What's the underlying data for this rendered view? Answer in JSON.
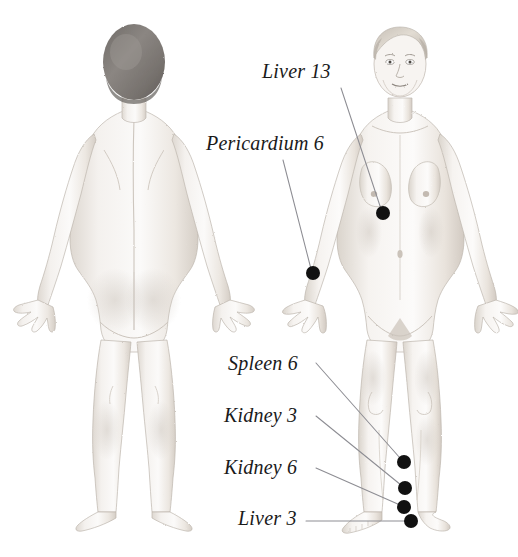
{
  "image": {
    "title": "Acupressure Points on Female Figure",
    "background_color": "#ffffff",
    "width": 518,
    "height": 557,
    "medium": "pencil-sketch illustration"
  },
  "figures": [
    {
      "id": "posterior-figure",
      "view": "back",
      "description": "Nude female figure viewed from behind, arms relaxed at sides, short dark hair",
      "bounds": {
        "x": 10,
        "y": 26,
        "width": 245,
        "height": 500
      }
    },
    {
      "id": "anterior-figure",
      "view": "front",
      "description": "Nude female figure viewed from the front, arms relaxed at sides, short light hair",
      "bounds": {
        "x": 285,
        "y": 26,
        "width": 225,
        "height": 505
      }
    }
  ],
  "labels": [
    {
      "id": "liver-13",
      "text": "Liver 13",
      "text_x": 262,
      "text_y": 61,
      "leader": {
        "x1": 341,
        "y1": 88,
        "x2": 381,
        "y2": 209
      },
      "point": {
        "x": 383,
        "y": 213,
        "r": 7
      }
    },
    {
      "id": "pericardium-6",
      "text": "Pericardium 6",
      "text_x": 206,
      "text_y": 133,
      "leader": {
        "x1": 283,
        "y1": 160,
        "x2": 311,
        "y2": 269
      },
      "point": {
        "x": 313,
        "y": 273,
        "r": 7
      }
    },
    {
      "id": "spleen-6",
      "text": "Spleen 6",
      "text_x": 228,
      "text_y": 353,
      "leader": {
        "x1": 316,
        "y1": 363,
        "x2": 400,
        "y2": 458
      },
      "point": {
        "x": 404,
        "y": 462,
        "r": 7
      }
    },
    {
      "id": "kidney-3",
      "text": "Kidney 3",
      "text_x": 224,
      "text_y": 405,
      "leader": {
        "x1": 316,
        "y1": 416,
        "x2": 401,
        "y2": 485
      },
      "point": {
        "x": 405,
        "y": 488,
        "r": 7
      }
    },
    {
      "id": "kidney-6",
      "text": "Kidney 6",
      "text_x": 224,
      "text_y": 457,
      "leader": {
        "x1": 316,
        "y1": 468,
        "x2": 400,
        "y2": 505
      },
      "point": {
        "x": 404,
        "y": 507,
        "r": 7
      }
    },
    {
      "id": "liver-3",
      "text": "Liver 3",
      "text_x": 238,
      "text_y": 508,
      "leader": {
        "x1": 306,
        "y1": 521,
        "x2": 405,
        "y2": 521
      },
      "point": {
        "x": 411,
        "y": 521,
        "r": 7
      }
    }
  ],
  "colors": {
    "background": "#ffffff",
    "point_marker": "#111111",
    "leader_line": "#8d8d93",
    "label_text": "#1a1a1a",
    "skin_light": "#f3f0ec",
    "skin_shade": "#d8d3cd",
    "hair_back": "#7e7a76",
    "hair_front": "#cfc8bf",
    "outline": "#b4ada6"
  }
}
